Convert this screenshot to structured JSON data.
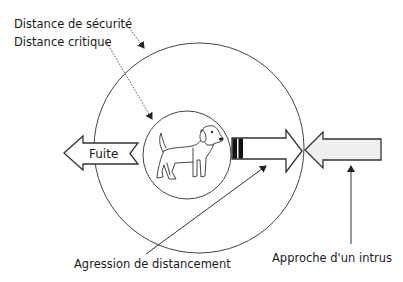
{
  "diagram": {
    "labels": {
      "safety_distance": "Distance de sécurité",
      "critical_distance": "Distance critique",
      "flight": "Fuite",
      "distancing_aggression": "Agression de distancement",
      "intruder_approach": "Approche d'un intrus"
    },
    "zones": [
      {
        "name": "outer-circle",
        "label": "Distance de sécurité",
        "cx": 199,
        "cy": 148,
        "r": 105
      },
      {
        "name": "inner-circle",
        "label": "Distance critique",
        "cx": 187,
        "cy": 155,
        "r": 44
      }
    ],
    "center_icon": "dog-icon",
    "colors": {
      "stroke": "#333333",
      "intruder_fill": "#efefef",
      "aggression_band": "#111111",
      "background": "#ffffff"
    }
  }
}
